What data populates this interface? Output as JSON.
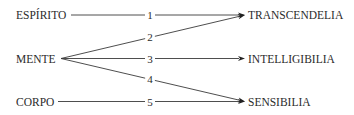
{
  "diagram": {
    "type": "directed-graph",
    "left_nodes": [
      {
        "id": "espirito",
        "label": "ESPÍRITO"
      },
      {
        "id": "mente",
        "label": "MENTE"
      },
      {
        "id": "corpo",
        "label": "CORPO"
      }
    ],
    "right_nodes": [
      {
        "id": "transcendelia",
        "label": "TRANSCENDELIA"
      },
      {
        "id": "intelligibilia",
        "label": "INTELLIGIBILIA"
      },
      {
        "id": "sensibilia",
        "label": "SENSIBILIA"
      }
    ],
    "edges": [
      {
        "from": "espirito",
        "to": "transcendelia",
        "label": "1"
      },
      {
        "from": "mente",
        "to": "transcendelia",
        "label": "2"
      },
      {
        "from": "mente",
        "to": "intelligibilia",
        "label": "3"
      },
      {
        "from": "mente",
        "to": "sensibilia",
        "label": "4"
      },
      {
        "from": "corpo",
        "to": "sensibilia",
        "label": "5"
      }
    ],
    "colors": {
      "text": "#2b2b2b",
      "line": "#3a3a3a",
      "background": "#ffffff"
    }
  }
}
